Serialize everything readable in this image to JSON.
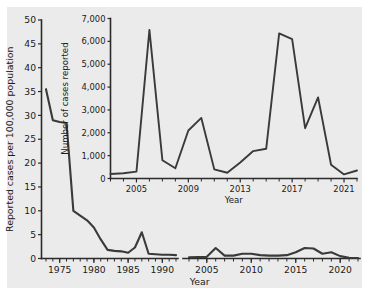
{
  "figure": {
    "background_color": "#ebebeb",
    "line_color": "#3a3a3a",
    "axis_color": "#2b2b2b"
  },
  "chart_data": {
    "type": "line",
    "title": "",
    "xlabel": "Year",
    "ylabel": "Reported cases per 100,000 population",
    "xlim": [
      1973,
      2022
    ],
    "ylim": [
      0,
      50
    ],
    "grid": false,
    "legend": "none",
    "axis_break": {
      "present": true,
      "between": [
        1992,
        2003
      ],
      "note": "x-axis broken between 1992 and 2003"
    },
    "y_ticks": [
      0,
      5,
      10,
      15,
      20,
      25,
      30,
      35,
      40,
      45,
      50
    ],
    "y_ticklabels": [
      "0",
      "5",
      "10",
      "15",
      "20",
      "25",
      "30",
      "35",
      "40",
      "45",
      "50"
    ],
    "x_ticks": [
      1975,
      1980,
      1985,
      1990,
      2005,
      2010,
      2015,
      2020
    ],
    "x_ticklabels": [
      "1975",
      "1980",
      "1985",
      "1990",
      "2005",
      "2010",
      "2015",
      "2020"
    ],
    "series": [
      {
        "name": "Reported cases per 100,000 population (1973-1992)",
        "x": [
          1973,
          1974,
          1975,
          1976,
          1977,
          1978,
          1979,
          1980,
          1981,
          1982,
          1983,
          1984,
          1985,
          1986,
          1987,
          1988,
          1989,
          1990,
          1991,
          1992
        ],
        "values": [
          35.5,
          29.0,
          28.6,
          28.4,
          10.0,
          9.0,
          8.0,
          6.5,
          4.0,
          1.8,
          1.6,
          1.5,
          1.2,
          2.3,
          5.5,
          1.0,
          0.9,
          0.8,
          0.8,
          0.7
        ]
      },
      {
        "name": "Reported cases per 100,000 population (2003-2022)",
        "x": [
          2003,
          2004,
          2005,
          2006,
          2007,
          2008,
          2009,
          2010,
          2011,
          2012,
          2013,
          2014,
          2015,
          2016,
          2017,
          2018,
          2019,
          2020,
          2021,
          2022
        ],
        "values": [
          0.25,
          0.3,
          0.35,
          2.2,
          0.6,
          0.6,
          1.0,
          1.0,
          0.7,
          0.6,
          0.6,
          0.7,
          1.3,
          2.2,
          2.1,
          1.0,
          1.3,
          0.5,
          0.15,
          0.1
        ]
      }
    ]
  },
  "inset_chart_data": {
    "type": "line",
    "title": "",
    "xlabel": "Year",
    "ylabel": "Number of cases reported",
    "xlim": [
      2003,
      2022
    ],
    "ylim": [
      0,
      7000
    ],
    "grid": false,
    "legend": "none",
    "y_ticks": [
      0,
      1000,
      2000,
      3000,
      4000,
      5000,
      6000,
      7000
    ],
    "y_ticklabels": [
      "0",
      "1,000",
      "2,000",
      "3,000",
      "4,000",
      "5,000",
      "6,000",
      "7,000"
    ],
    "x_ticks": [
      2005,
      2009,
      2013,
      2017,
      2021
    ],
    "x_ticklabels": [
      "2005",
      "2009",
      "2013",
      "2017",
      "2021"
    ],
    "x_minor_ticks": [
      2003,
      2004,
      2006,
      2007,
      2008,
      2010,
      2011,
      2012,
      2014,
      2015,
      2016,
      2018,
      2019,
      2020,
      2022
    ],
    "series": [
      {
        "name": "Number of cases reported",
        "x": [
          2003,
          2004,
          2005,
          2006,
          2007,
          2008,
          2009,
          2010,
          2011,
          2012,
          2013,
          2014,
          2015,
          2016,
          2017,
          2018,
          2019,
          2020,
          2021,
          2022
        ],
        "values": [
          200,
          230,
          300,
          6500,
          800,
          450,
          2100,
          2650,
          400,
          250,
          700,
          1200,
          1300,
          6350,
          6100,
          2200,
          3550,
          600,
          180,
          350
        ]
      }
    ]
  }
}
